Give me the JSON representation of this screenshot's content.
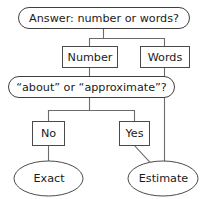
{
  "diagram": {
    "nodes": {
      "question_top": {
        "label": "Answer: number or words?",
        "shape": "rounded-rect"
      },
      "number": {
        "label": "Number",
        "shape": "rect"
      },
      "words": {
        "label": "Words",
        "shape": "rect"
      },
      "question_about": {
        "label": "“about” or “approximate”?",
        "shape": "rounded-rect"
      },
      "no": {
        "label": "No",
        "shape": "rect"
      },
      "yes": {
        "label": "Yes",
        "shape": "rect"
      },
      "exact": {
        "label": "Exact",
        "shape": "ellipse"
      },
      "estimate": {
        "label": "Estimate",
        "shape": "ellipse"
      }
    },
    "edges": [
      {
        "from": "question_top",
        "to": "number"
      },
      {
        "from": "question_top",
        "to": "words"
      },
      {
        "from": "number",
        "to": "question_about"
      },
      {
        "from": "question_about",
        "to": "no"
      },
      {
        "from": "question_about",
        "to": "yes"
      },
      {
        "from": "no",
        "to": "exact"
      },
      {
        "from": "yes",
        "to": "estimate"
      },
      {
        "from": "words",
        "to": "estimate"
      }
    ],
    "colors": {
      "background": "#ffffff",
      "node_stroke": "#4a4a4a",
      "connector": "#6b6b6b",
      "text": "#1a1a1a"
    }
  }
}
